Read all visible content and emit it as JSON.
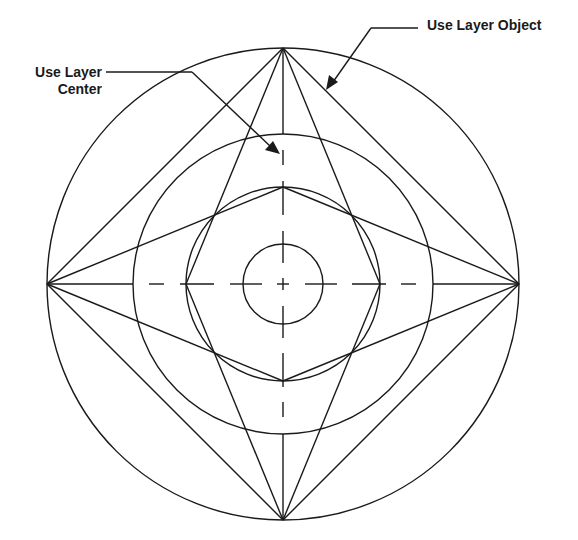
{
  "diagram": {
    "labels": {
      "use_layer_object": "Use Layer Object",
      "use_layer_center_line1": "Use Layer",
      "use_layer_center_line2": "Center"
    },
    "colors": {
      "line": "#1a1a1a",
      "background": "#ffffff"
    },
    "geometry": {
      "center": [
        283,
        284
      ],
      "circle_radii": [
        236,
        150,
        97,
        40
      ],
      "quadrant_points": [
        "top",
        "right",
        "bottom",
        "left"
      ]
    }
  }
}
